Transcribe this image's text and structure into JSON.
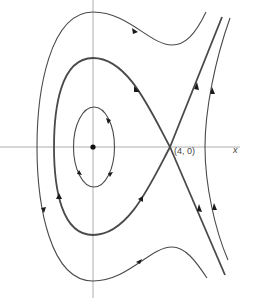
{
  "figure": {
    "type": "phase-portrait",
    "labels": {
      "saddle_point": "(4, 0)",
      "x_axis": "x"
    },
    "critical_points": [
      {
        "name": "center",
        "coords": "(0, 0)",
        "type": "center"
      },
      {
        "name": "saddle",
        "coords": "(4, 0)",
        "type": "saddle"
      }
    ],
    "colors": {
      "curve": "#4a4a4a",
      "axis": "#9a9a9a",
      "arrow": "#1a1a1a",
      "background": "#ffffff"
    }
  }
}
